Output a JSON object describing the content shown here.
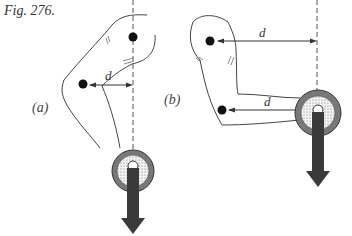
{
  "figure": {
    "label": "Fig. 276.",
    "panels": [
      {
        "id": "a",
        "label": "(a)",
        "distance_label": "d"
      },
      {
        "id": "b",
        "label": "(b)",
        "distance_label_upper": "d",
        "distance_label_lower": "d"
      }
    ]
  },
  "colors": {
    "line": "#444444",
    "dot": "#111111",
    "arrow": "#333333",
    "weight_ring": "#555555"
  }
}
